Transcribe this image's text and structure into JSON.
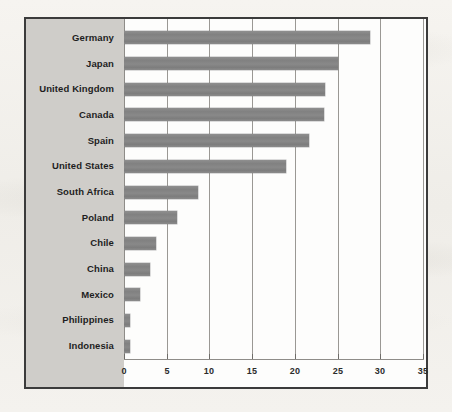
{
  "chart_data": {
    "type": "bar",
    "orientation": "horizontal",
    "title": "",
    "subtitle": "",
    "xlabel": "",
    "ylabel": "",
    "categories": [
      "Germany",
      "Japan",
      "United Kingdom",
      "Canada",
      "Spain",
      "United States",
      "South Africa",
      "Poland",
      "Chile",
      "China",
      "Mexico",
      "Philippines",
      "Indonesia"
    ],
    "values": [
      28.8,
      25.0,
      23.5,
      23.4,
      21.7,
      19.0,
      8.7,
      6.2,
      3.7,
      3.0,
      1.9,
      0.7,
      0.7
    ],
    "xlim": [
      0,
      35
    ],
    "xticks": [
      0,
      5,
      10,
      15,
      20,
      25,
      30,
      35
    ],
    "xtick_labels": [
      "0",
      "5",
      "10",
      "15",
      "20",
      "25",
      "30",
      "35"
    ],
    "grid": true,
    "grid_axis": "x",
    "legend": false,
    "legend_position": "none",
    "series": [
      {
        "name": "value",
        "values": [
          28.8,
          25.0,
          23.5,
          23.4,
          21.7,
          19.0,
          8.7,
          6.2,
          3.7,
          3.0,
          1.9,
          0.7,
          0.7
        ]
      }
    ]
  },
  "style": {
    "bar_color": "#8a8a8a",
    "label_panel_color": "#cfcdc9",
    "plot_background": "#fdfdfc",
    "frame_border_color": "#3b3b3b",
    "gridline_color": "#9a9894",
    "axis_color": "#8e8c88",
    "text_color": "#1e1e1e",
    "page_background": "#f2f0ec"
  }
}
